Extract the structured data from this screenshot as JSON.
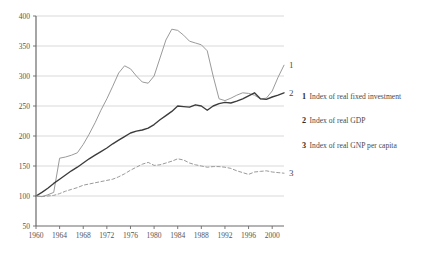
{
  "chart_data": {
    "type": "line",
    "title": "",
    "subtitle": "",
    "xlabel": "",
    "ylabel": "",
    "xlim": [
      1960,
      2002
    ],
    "ylim": [
      50,
      400
    ],
    "ytick_values": [
      50,
      100,
      150,
      200,
      250,
      300,
      350,
      400
    ],
    "ytick_labels": [
      "50",
      "100",
      "150",
      "200",
      "250",
      "300",
      "350",
      "400"
    ],
    "xtick_values": [
      1960,
      1964,
      1968,
      1972,
      1976,
      1980,
      1984,
      1988,
      1992,
      1996,
      2000
    ],
    "xtick_labels": [
      "1960",
      "1964",
      "1968",
      "1972",
      "1976",
      "1980",
      "1984",
      "1988",
      "1992",
      "1996",
      "2000"
    ],
    "grid": "horizontal",
    "legend_position": "right",
    "x": [
      1960,
      1961,
      1962,
      1963,
      1964,
      1965,
      1966,
      1967,
      1968,
      1969,
      1970,
      1971,
      1972,
      1973,
      1974,
      1975,
      1976,
      1977,
      1978,
      1979,
      1980,
      1981,
      1982,
      1983,
      1984,
      1985,
      1986,
      1987,
      1988,
      1989,
      1990,
      1991,
      1992,
      1993,
      1994,
      1995,
      1996,
      1997,
      1998,
      1999,
      2000,
      2001,
      2002
    ],
    "series": [
      {
        "name": "Index of real fixed investment",
        "key": "1",
        "color": "#9a9a9a",
        "style": "solid",
        "tag_label": "1",
        "values": [
          100,
          99,
          102,
          106,
          163,
          165,
          168,
          172,
          186,
          203,
          222,
          243,
          262,
          283,
          305,
          317,
          312,
          300,
          290,
          288,
          300,
          330,
          360,
          378,
          376,
          368,
          358,
          355,
          352,
          342,
          300,
          262,
          259,
          263,
          268,
          272,
          271,
          268,
          262,
          263,
          275,
          298,
          318
        ]
      },
      {
        "name": "Index of real GDP",
        "key": "2",
        "color": "#3c3c3c",
        "style": "solid",
        "tag_label": "2",
        "values": [
          100,
          106,
          113,
          121,
          128,
          135,
          142,
          148,
          155,
          162,
          168,
          174,
          180,
          187,
          193,
          199,
          205,
          208,
          210,
          213,
          219,
          227,
          234,
          241,
          250,
          249,
          248,
          252,
          250,
          243,
          250,
          254,
          256,
          255,
          258,
          262,
          267,
          272,
          262,
          261,
          265,
          268,
          272
        ]
      },
      {
        "name": "Index of real GNP per capita",
        "key": "3",
        "color": "#9a9a9a",
        "style": "dashed",
        "tag_label": "3",
        "values": [
          100,
          99,
          100,
          101,
          104,
          108,
          111,
          114,
          118,
          120,
          122,
          124,
          126,
          128,
          132,
          137,
          143,
          148,
          153,
          156,
          151,
          152,
          155,
          158,
          162,
          160,
          155,
          152,
          150,
          148,
          149,
          149,
          148,
          146,
          142,
          139,
          136,
          140,
          141,
          142,
          140,
          139,
          138
        ]
      }
    ]
  },
  "legend": {
    "entries": [
      {
        "key": "1",
        "label": "Index of real fixed investment"
      },
      {
        "key": "2",
        "label": "Index of real GDP"
      },
      {
        "key": "3",
        "label": "Index of real GNP per capita"
      }
    ]
  }
}
